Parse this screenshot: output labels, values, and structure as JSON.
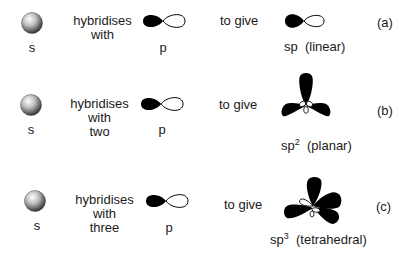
{
  "diagram": {
    "rows": [
      {
        "id": "a",
        "s_label": "s",
        "verb_lines": [
          "hybridises",
          "with"
        ],
        "p_label": "p",
        "result_text": "to give",
        "hybrid_base": "sp",
        "hybrid_sup": "",
        "geometry": "(linear)",
        "row_tag": "(a)"
      },
      {
        "id": "b",
        "s_label": "s",
        "verb_lines": [
          "hybridises",
          "with",
          "two"
        ],
        "p_label": "p",
        "result_text": "to give",
        "hybrid_base": "sp",
        "hybrid_sup": "2",
        "geometry": "(planar)",
        "row_tag": "(b)"
      },
      {
        "id": "c",
        "s_label": "s",
        "verb_lines": [
          "hybridises",
          "with",
          "three"
        ],
        "p_label": "p",
        "result_text": "to give",
        "hybrid_base": "sp",
        "hybrid_sup": "3",
        "geometry": "(tetrahedral)",
        "row_tag": "(c)"
      }
    ],
    "colors": {
      "lobe_fill": "#000000",
      "lobe_outline": "#000000",
      "sphere_light": "#ffffff",
      "sphere_dark": "#3a3a3a",
      "background": "#ffffff"
    },
    "icons": {
      "s_orbital": "shaded-sphere",
      "p_orbital": "dumbbell-one-filled-lobe",
      "sp": "two-lobe-hybrid",
      "sp2": "trigonal-three-lobe",
      "sp3": "tetrahedral-four-lobe"
    }
  }
}
